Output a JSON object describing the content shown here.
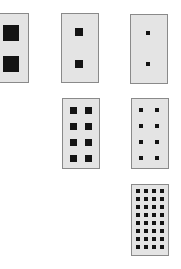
{
  "figure": {
    "colors": {
      "background": "#ffffff",
      "panel_fill": "#e4e4e4",
      "panel_border": "#8a8a8a",
      "square": "#141414"
    },
    "panels": [
      {
        "id": "p1",
        "x": -9,
        "y": 13,
        "w": 38,
        "h": 70,
        "cols": 1,
        "rows": 2,
        "sq": 16,
        "col_centers": [
          11
        ],
        "row_centers": [
          33,
          64
        ]
      },
      {
        "id": "p2",
        "x": 61,
        "y": 13,
        "w": 38,
        "h": 70,
        "cols": 1,
        "rows": 2,
        "sq": 8,
        "col_centers": [
          79
        ],
        "row_centers": [
          32,
          64
        ]
      },
      {
        "id": "p3",
        "x": 130,
        "y": 14,
        "w": 38,
        "h": 70,
        "cols": 1,
        "rows": 2,
        "sq": 4,
        "col_centers": [
          148
        ],
        "row_centers": [
          33,
          64
        ]
      },
      {
        "id": "p4",
        "x": 62,
        "y": 98,
        "w": 38,
        "h": 71,
        "cols": 2,
        "rows": 4,
        "sq": 7,
        "col_centers": [
          73,
          88
        ],
        "row_centers": [
          110,
          126,
          142,
          158
        ]
      },
      {
        "id": "p5",
        "x": 131,
        "y": 98,
        "w": 38,
        "h": 71,
        "cols": 2,
        "rows": 4,
        "sq": 4,
        "col_centers": [
          141,
          157
        ],
        "row_centers": [
          110,
          126,
          142,
          158
        ]
      },
      {
        "id": "p6",
        "x": 131,
        "y": 184,
        "w": 38,
        "h": 72,
        "cols": 4,
        "rows": 8,
        "sq": 4,
        "col_centers": [
          138,
          146,
          154,
          162
        ],
        "row_centers": [
          191,
          199,
          207,
          215,
          223,
          231,
          239,
          247
        ]
      }
    ]
  }
}
